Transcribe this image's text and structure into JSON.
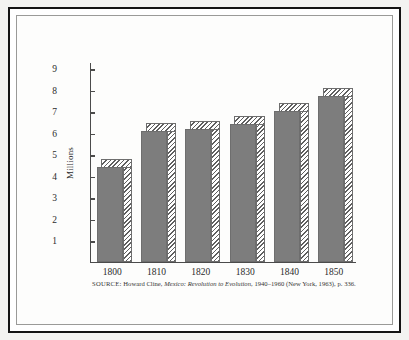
{
  "figure": {
    "source_note": {
      "label": "SOURCE:",
      "author": "Howard Cline,",
      "title": "Mexico: Revolution to Evolution,",
      "rest": "1940–1960 (New York, 1963), p. 336."
    }
  },
  "chart_data": {
    "type": "bar",
    "title": "",
    "xlabel": "",
    "ylabel": "Millions",
    "categories": [
      "1800",
      "1810",
      "1820",
      "1830",
      "1840",
      "1850"
    ],
    "values": [
      4.4,
      6.1,
      6.2,
      6.4,
      7.0,
      7.7
    ],
    "ylim": [
      0,
      9.3
    ],
    "yticks": [
      1,
      2,
      3,
      4,
      5,
      6,
      7,
      8,
      9
    ],
    "ytick_labels": [
      "1",
      "2",
      "3",
      "4",
      "5",
      "6",
      "7",
      "8",
      "9"
    ],
    "grid": false,
    "legend": false,
    "style": "3d-shaded-bars",
    "bar_fill_color": "#7d7d7d",
    "bar_hatch_color": "#5f5f5f",
    "axis_color": "#4b4b4b"
  }
}
